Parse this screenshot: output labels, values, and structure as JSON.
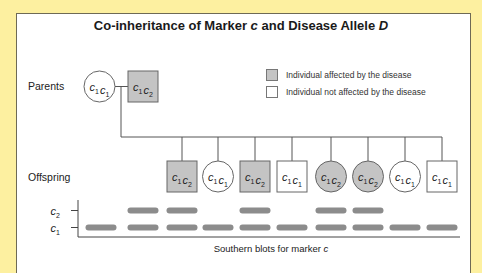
{
  "title": {
    "prefix": "Co-inheritance of Marker ",
    "marker": "c",
    "middle": " and Disease Allele ",
    "allele": "D"
  },
  "row_labels": {
    "parents": "Parents",
    "offspring": "Offspring"
  },
  "legend": {
    "affected": "Individual affected by the disease",
    "unaffected": "Individual not affected by the disease"
  },
  "colors": {
    "background": "#fdf0a0",
    "affected_fill": "#c4c4c4",
    "band": "#8c8c8c",
    "line": "#555555"
  },
  "pedigree": {
    "parents": [
      {
        "sex": "female",
        "affected": false,
        "genotype": [
          "c1",
          "c1"
        ]
      },
      {
        "sex": "male",
        "affected": true,
        "genotype": [
          "c1",
          "c2"
        ]
      }
    ],
    "offspring": [
      {
        "sex": "male",
        "affected": true,
        "genotype": [
          "c1",
          "c2"
        ]
      },
      {
        "sex": "female",
        "affected": false,
        "genotype": [
          "c1",
          "c1"
        ]
      },
      {
        "sex": "male",
        "affected": true,
        "genotype": [
          "c1",
          "c2"
        ]
      },
      {
        "sex": "male",
        "affected": false,
        "genotype": [
          "c1",
          "c1"
        ]
      },
      {
        "sex": "female",
        "affected": true,
        "genotype": [
          "c1",
          "c2"
        ]
      },
      {
        "sex": "female",
        "affected": true,
        "genotype": [
          "c1",
          "c2"
        ]
      },
      {
        "sex": "female",
        "affected": false,
        "genotype": [
          "c1",
          "c1"
        ]
      },
      {
        "sex": "male",
        "affected": false,
        "genotype": [
          "c1",
          "c1"
        ]
      }
    ]
  },
  "blot": {
    "band_labels": [
      "c2",
      "c1"
    ],
    "caption_prefix": "Southern blots for marker ",
    "caption_marker": "c",
    "lanes": [
      {
        "c2": false,
        "c1": true
      },
      {
        "c2": true,
        "c1": true
      },
      {
        "c2": true,
        "c1": true
      },
      {
        "c2": false,
        "c1": true
      },
      {
        "c2": true,
        "c1": true
      },
      {
        "c2": false,
        "c1": true
      },
      {
        "c2": true,
        "c1": true
      },
      {
        "c2": true,
        "c1": true
      },
      {
        "c2": false,
        "c1": true
      },
      {
        "c2": false,
        "c1": true
      }
    ]
  }
}
